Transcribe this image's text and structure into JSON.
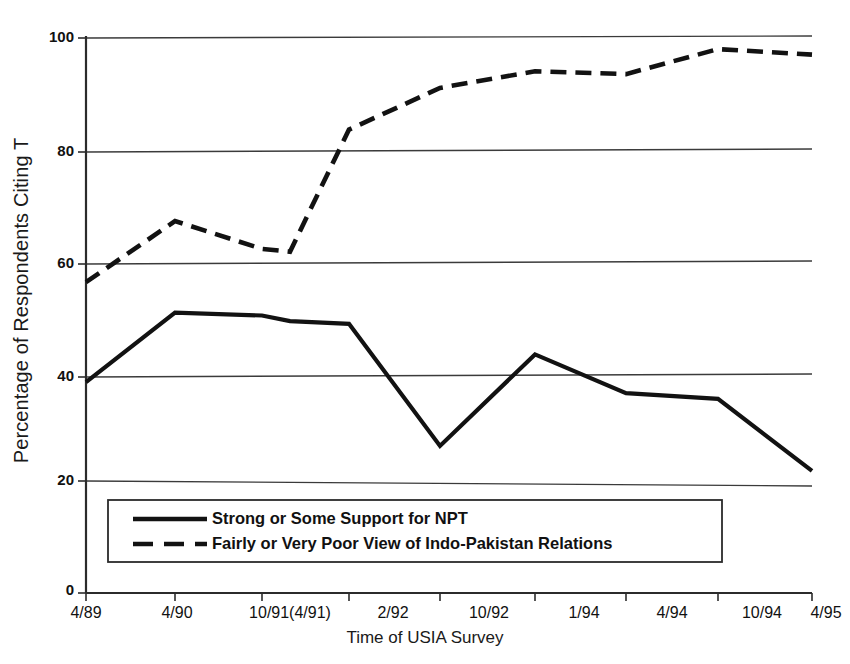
{
  "chart_data": {
    "type": "line",
    "title": "",
    "xlabel": "Time of USIA Survey",
    "ylabel": "Percentage of Respondents Citing T",
    "ylim": [
      0,
      100
    ],
    "yticks": [
      0,
      20,
      40,
      60,
      80,
      100
    ],
    "ytick_labels": [
      "0",
      "20",
      "40",
      "60",
      "80",
      "100"
    ],
    "grid": "horizontal",
    "legend_position": "inside-bottom-left",
    "categories": [
      "4/89",
      "4/90",
      "10/91",
      "(4/91)",
      "2/92",
      "10/92",
      "1/94",
      "4/94",
      "10/94",
      "4/95"
    ],
    "xtick_labels": [
      "4/89",
      "4/90",
      "10/91(4/91)",
      "2/92",
      "10/92",
      "1/94",
      "4/94",
      "10/94",
      "4/95"
    ],
    "series": [
      {
        "name": "Strong or Some Support for NPT",
        "style": "solid",
        "values": [
          38,
          50.5,
          50,
          49,
          48.5,
          26.5,
          43,
          36,
          35,
          22
        ]
      },
      {
        "name": "Fairly or Very Poor View of Indo-Pakistan Relations",
        "style": "dashed",
        "values": [
          56,
          67,
          62,
          61.5,
          83.5,
          91,
          94,
          93.5,
          98,
          97
        ]
      }
    ]
  },
  "legend": {
    "entries": [
      {
        "label": "Strong or Some Support for NPT",
        "style": "solid"
      },
      {
        "label": "Fairly or Very Poor View of Indo-Pakistan Relations",
        "style": "dashed"
      }
    ]
  },
  "axis": {
    "y_title": "Percentage of Respondents Citing T",
    "x_title": "Time of USIA Survey",
    "y_labels": [
      "100",
      "80",
      "60",
      "40",
      "20",
      "0"
    ],
    "x_labels": [
      "4/89",
      "4/90",
      "10/91(4/91)",
      "2/92",
      "10/92",
      "1/94",
      "4/94",
      "10/94",
      "4/95"
    ]
  },
  "colors": {
    "line": "#121212",
    "grid": "#3b3b3b",
    "axis": "#2b2b2b",
    "background": "#ffffff"
  }
}
